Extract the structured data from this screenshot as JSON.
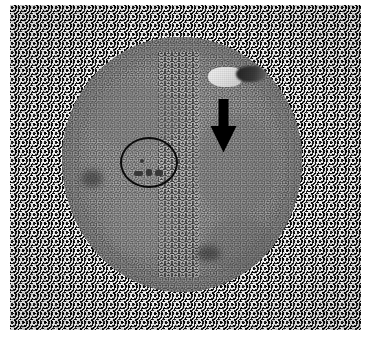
{
  "figure": {
    "domain": "micrograph",
    "modality": "light microscopy",
    "width_px": 371,
    "height_px": 337,
    "background_color": "#ffffff",
    "plate": {
      "left_px": 10,
      "top_px": 5,
      "width_px": 351,
      "height_px": 325,
      "base_color": "#8a8a8a",
      "surround_description": "high-contrast black and white speckled granular background"
    }
  },
  "specimen": {
    "label": "cell-body",
    "shape": "round / slightly ovoid",
    "fill_color": "#888888",
    "bounds": {
      "left_px": 62,
      "top_px": 37,
      "width_px": 240,
      "height_px": 255
    },
    "internal_features": [
      {
        "name": "cortex-ring",
        "description": "lighter peripheral rim band"
      },
      {
        "name": "granular-seam",
        "description": "vertical granular seam through the centre"
      },
      {
        "name": "vertical-striation",
        "description": "fine vertical scan striations across the cytoplasm"
      }
    ]
  },
  "inclusions": [
    {
      "name": "bright-inclusion",
      "description": "bright white refractile blob",
      "color": "#f0f0f0",
      "bounds": {
        "left_px": 208,
        "top_px": 67,
        "width_px": 34,
        "height_px": 20
      }
    },
    {
      "name": "dark-patch",
      "description": "adjacent dark grey patch",
      "color": "#2e2e2e",
      "bounds": {
        "left_px": 236,
        "top_px": 66,
        "width_px": 30,
        "height_px": 16
      }
    }
  ],
  "annotations": [
    {
      "name": "down-arrow",
      "type": "arrow",
      "direction": "down",
      "color": "#000000",
      "bounds": {
        "left_px": 210,
        "top_px": 99,
        "width_px": 27,
        "height_px": 54
      },
      "points_at": "bright-inclusion / dark-patch region at the cell periphery"
    },
    {
      "name": "circle-annotation",
      "type": "ellipse-outline",
      "color": "#0c0c0c",
      "stroke_width_px": 2,
      "fill": "none",
      "bounds": {
        "left_px": 120,
        "top_px": 137,
        "width_px": 58,
        "height_px": 51
      },
      "encircles": "small dark granular structures in the cytoplasm"
    }
  ],
  "palette": {
    "page": "#ffffff",
    "cell_mid_grey": "#888888",
    "cell_light_grey": "#9a9a9a",
    "cell_dark_grey": "#6f6f6f",
    "annotation_black": "#000000",
    "highlight_white": "#f4f4f4"
  }
}
